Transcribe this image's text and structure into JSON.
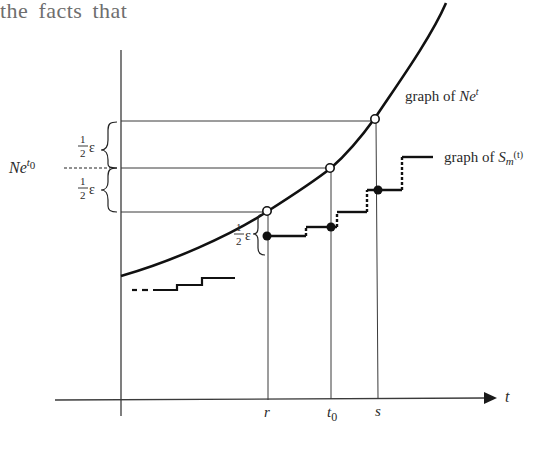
{
  "heading": {
    "text": "the facts that"
  },
  "diagram": {
    "curve_label_prefix": "graph of ",
    "curve_label_N": "N",
    "curve_label_e": "e",
    "curve_label_sup": "t",
    "step_label_prefix": "graph of ",
    "step_label_S": "S",
    "step_label_sub": "m",
    "step_label_sup": "(t)",
    "y_label_N": "N",
    "y_label_e": "e",
    "y_label_sup": "t",
    "y_label_sub0": "0",
    "half_num": "1",
    "half_den": "2",
    "epsilon": "ε",
    "x_axis_label": "t",
    "tick_r": "r",
    "tick_t": "t",
    "tick_t_sub": "0",
    "tick_s": "s"
  },
  "colors": {
    "ink": "#1a1a1a",
    "thin": "#3a3a3a",
    "heading": "#6e6e6e"
  }
}
